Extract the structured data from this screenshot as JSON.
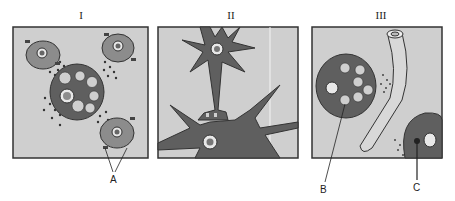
{
  "panels": [
    {
      "id": "I",
      "label": "I",
      "description": "large cell with granules surrounded by three smaller cells; released granules between them"
    },
    {
      "id": "II",
      "label": "II",
      "description": "two nerve cells (neurons) connected at a synapse"
    },
    {
      "id": "III",
      "label": "III",
      "description": "granular cell and blood vessel with dots diffusing toward a second cell"
    }
  ],
  "callouts": {
    "A": "A",
    "B": "B",
    "C": "C"
  },
  "colors": {
    "background": "#cfcfcf",
    "cell_dark": "#5f5f5f",
    "cell_mid": "#8c8c8c",
    "border": "#333333",
    "vessel": "#d8d8d8"
  }
}
